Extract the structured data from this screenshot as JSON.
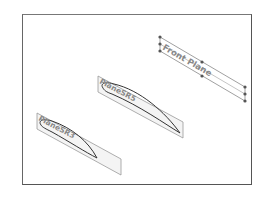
{
  "viewport": {
    "border_color": "#555555",
    "planes": [
      {
        "name": "front-plane",
        "label": "Front Plane",
        "selected": true
      },
      {
        "name": "plane-sr5",
        "label": "PlaneSR5",
        "selected": false
      },
      {
        "name": "plane-sr3",
        "label": "PlaneSR3",
        "selected": false
      }
    ]
  }
}
